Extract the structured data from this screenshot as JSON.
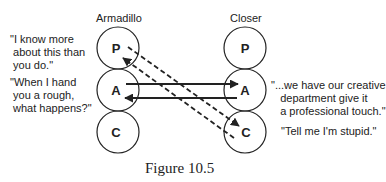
{
  "diagram": {
    "left": {
      "title": "Armadillo",
      "states": [
        "P",
        "A",
        "C"
      ]
    },
    "right": {
      "title": "Closer",
      "states": [
        "P",
        "A",
        "C"
      ]
    },
    "quotes": {
      "left_p": "\"I know more\n about this than\n you do.\"",
      "left_a": "\"When I hand\n you a rough,\n what happens?\"",
      "right_a": "\"...we have our creative\n   department give it\n   a professional touch.\"",
      "right_c": "\"Tell me I'm stupid.\""
    },
    "transactions": [
      {
        "from": "Armadillo.A",
        "to": "Closer.A",
        "style": "solid"
      },
      {
        "from": "Closer.A",
        "to": "Armadillo.A",
        "style": "solid"
      },
      {
        "from": "Armadillo.P",
        "to": "Closer.C",
        "style": "dashed"
      },
      {
        "from": "Closer.C",
        "to": "Armadillo.P",
        "style": "dashed"
      }
    ],
    "caption": "Figure 10.5",
    "colors": {
      "ink": "#222222",
      "background": "#ffffff"
    }
  }
}
